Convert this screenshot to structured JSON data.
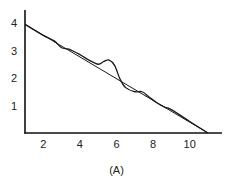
{
  "chart_data": {
    "type": "line",
    "title": "",
    "caption": "(A)",
    "xlabel": "",
    "ylabel": "",
    "xlim": [
      1,
      11.6
    ],
    "ylim": [
      0,
      4.4
    ],
    "x_ticks": [
      2,
      4,
      6,
      8,
      10
    ],
    "y_ticks": [
      1,
      2,
      3,
      4
    ],
    "grid": false,
    "legend": null,
    "series": [
      {
        "name": "linear fit",
        "style": "thin straight line",
        "x": [
          1,
          11
        ],
        "y": [
          3.95,
          0.0
        ]
      },
      {
        "name": "data curve",
        "style": "wavy line",
        "x": [
          1,
          2,
          2.6,
          3.0,
          3.4,
          4.0,
          4.5,
          5.0,
          5.3,
          5.6,
          5.9,
          6.2,
          6.5,
          7.0,
          7.4,
          7.8,
          8.2,
          8.6,
          9.0,
          10.0,
          11.0
        ],
        "y": [
          3.95,
          3.55,
          3.35,
          3.1,
          3.05,
          2.85,
          2.65,
          2.5,
          2.6,
          2.65,
          2.45,
          1.95,
          1.65,
          1.5,
          1.5,
          1.3,
          1.1,
          0.95,
          0.85,
          0.42,
          0.0
        ]
      }
    ]
  },
  "figure": {
    "caption": "(A)",
    "x_tick_labels": [
      "2",
      "4",
      "6",
      "8",
      "10"
    ],
    "y_tick_labels": [
      "1",
      "2",
      "3",
      "4"
    ]
  }
}
